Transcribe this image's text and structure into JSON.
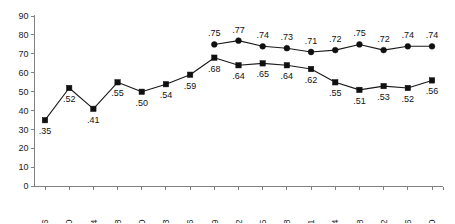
{
  "chart_data": {
    "type": "line",
    "title": "",
    "subtitle": "",
    "xlabel": "",
    "ylabel": "",
    "ylim": [
      0,
      90
    ],
    "yticks": [
      0,
      10,
      20,
      30,
      40,
      50,
      60,
      70,
      80,
      90
    ],
    "grid": false,
    "legend": "none",
    "categories": [
      "1956",
      "1960",
      "1964",
      "1968",
      "1970",
      "1973",
      "1976",
      "1979",
      "1982",
      "1985",
      "1988",
      "1991",
      "1994",
      "1998",
      "2002",
      "2006",
      "2010"
    ],
    "series": [
      {
        "name": "upper-series",
        "marker": "circle",
        "label_position": "above",
        "values": [
          null,
          null,
          null,
          null,
          null,
          null,
          null,
          75,
          77,
          74,
          73,
          71,
          72,
          75,
          72,
          74,
          74
        ],
        "labels": [
          "",
          "",
          "",
          "",
          "",
          "",
          "",
          ".75",
          ".77",
          ".74",
          ".73",
          ".71",
          ".72",
          ".75",
          ".72",
          ".74",
          ".74"
        ]
      },
      {
        "name": "lower-series",
        "marker": "square",
        "label_position": "below",
        "values": [
          35,
          52,
          41,
          55,
          50,
          54,
          59,
          68,
          64,
          65,
          64,
          62,
          55,
          51,
          53,
          52,
          56
        ],
        "labels": [
          ".35",
          ".52",
          ".41",
          ".55",
          ".50",
          ".54",
          ".59",
          ".68",
          ".64",
          ".65",
          ".64",
          ".62",
          ".55",
          ".51",
          ".53",
          ".52",
          ".56"
        ]
      }
    ],
    "colors": {
      "series_line": "#1a1a1a",
      "marker": "#101010",
      "axis": "#808080",
      "text": "#222222",
      "background": "#ffffff"
    }
  }
}
